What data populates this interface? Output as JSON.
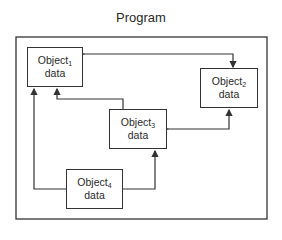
{
  "diagram": {
    "title": "Program",
    "objects": [
      {
        "id": "object1",
        "name": "Object",
        "subscript": "1",
        "label2": "data"
      },
      {
        "id": "object2",
        "name": "Object",
        "subscript": "2",
        "label2": "data"
      },
      {
        "id": "object3",
        "name": "Object",
        "subscript": "3",
        "label2": "data"
      },
      {
        "id": "object4",
        "name": "Object",
        "subscript": "4",
        "label2": "data"
      }
    ],
    "connections": [
      {
        "from": "object1",
        "to": "object2",
        "bidirectional": true
      },
      {
        "from": "object3",
        "to": "object2",
        "bidirectional": true
      },
      {
        "from": "object3",
        "to": "object1",
        "bidirectional": false
      },
      {
        "from": "object4",
        "to": "object1",
        "bidirectional": false
      },
      {
        "from": "object4",
        "to": "object3",
        "bidirectional": false
      }
    ],
    "line_color": "#333333"
  }
}
